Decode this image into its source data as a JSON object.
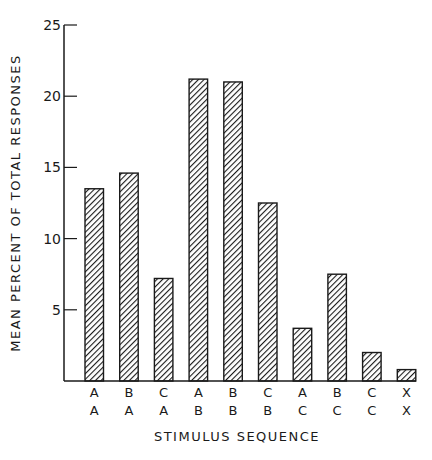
{
  "chart_data": {
    "type": "bar",
    "title": "",
    "xlabel": "STIMULUS SEQUENCE",
    "ylabel": "MEAN PERCENT OF TOTAL RESPONSES",
    "ylim": [
      0,
      25
    ],
    "yticks": [
      5,
      10,
      15,
      20,
      25
    ],
    "grid": false,
    "legend": null,
    "categories": [
      "A/A",
      "B/A",
      "C/A",
      "A/B",
      "B/B",
      "C/B",
      "A/C",
      "B/C",
      "C/C",
      "X/X"
    ],
    "category_rows": {
      "top": [
        "A",
        "B",
        "C",
        "A",
        "B",
        "C",
        "A",
        "B",
        "C",
        "X"
      ],
      "bottom": [
        "A",
        "A",
        "A",
        "B",
        "B",
        "B",
        "C",
        "C",
        "C",
        "X"
      ]
    },
    "values": [
      13.5,
      14.6,
      7.2,
      21.2,
      21.0,
      12.5,
      3.7,
      7.5,
      2.0,
      0.8
    ],
    "bar_fill": "diagonal-hatch",
    "colors": {
      "ink": "#1a1a1a",
      "background": "#ffffff"
    }
  }
}
